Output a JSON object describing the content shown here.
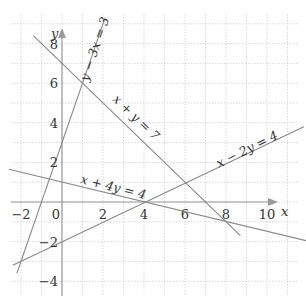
{
  "chart_data": {
    "type": "line",
    "title": "",
    "xlabel": "x",
    "ylabel": "y",
    "xlim": [
      -2.5,
      11.5
    ],
    "ylim": [
      -4.7,
      9.4
    ],
    "grid": true,
    "x_ticks": [
      -2,
      0,
      2,
      4,
      6,
      8,
      10
    ],
    "y_ticks": [
      -4,
      -2,
      2,
      4,
      6,
      8
    ],
    "x_tick_labels": [
      "−2",
      "0",
      "2",
      "4",
      "6",
      "8",
      "10"
    ],
    "y_tick_labels": [
      "−4",
      "−2",
      "2",
      "4",
      "6",
      "8"
    ],
    "series": [
      {
        "name": "y − 3x = 3",
        "equation": "y = 3x + 3",
        "x": [
          -2.2,
          2.1
        ],
        "y": [
          -3.6,
          9.3
        ]
      },
      {
        "name": "x + y = 7",
        "equation": "y = 7 - x",
        "x": [
          -1.4,
          8.7
        ],
        "y": [
          8.4,
          -1.7
        ]
      },
      {
        "name": "x − 2y = 4",
        "equation": "y = (x - 4)/2",
        "x": [
          -2.4,
          11.8
        ],
        "y": [
          -3.2,
          3.8
        ]
      },
      {
        "name": "x + 4y = 4",
        "equation": "y = (4 - x)/4",
        "x": [
          -2.6,
          11.9
        ],
        "y": [
          1.65,
          -1.95
        ]
      }
    ],
    "intersections": [
      {
        "x": 1,
        "y": 6
      },
      {
        "x": 6,
        "y": 1
      },
      {
        "x": 4,
        "y": 0
      },
      {
        "x": 8,
        "y": -1
      },
      {
        "x": -2,
        "y": -3
      },
      {
        "x": -0.73,
        "y": 1.18
      }
    ],
    "labels": {
      "l1": "y − 3x = 3",
      "l2": "x + y = 7",
      "l3": "x − 2y = 4",
      "l4": "x + 4y = 4",
      "x_axis": "x",
      "y_axis": "y"
    }
  },
  "colors": {
    "grid": "#c8c8c8",
    "axis": "#9a9a9a",
    "line": "#8a8a8a",
    "text": "#333333"
  }
}
